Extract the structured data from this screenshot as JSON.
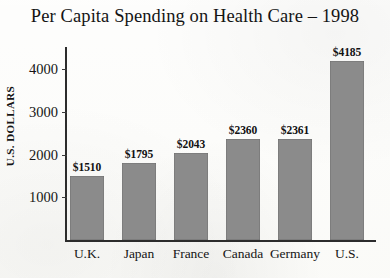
{
  "chart_data": {
    "type": "bar",
    "title": "Per Capita Spending on Health Care – 1998",
    "xlabel": "",
    "ylabel": "U.S. DOLLARS",
    "categories": [
      "U.K.",
      "Japan",
      "France",
      "Canada",
      "Germany",
      "U.S."
    ],
    "values": [
      1510,
      1795,
      2043,
      2360,
      2361,
      4185
    ],
    "value_labels": [
      "$1510",
      "$1795",
      "$2043",
      "$2360",
      "$2361",
      "$4185"
    ],
    "ylim": [
      0,
      4500
    ],
    "yticks": [
      1000,
      2000,
      3000,
      4000
    ],
    "ytick_labels": [
      "1000",
      "2000",
      "3000",
      "4000"
    ],
    "grid": false,
    "legend": null,
    "bar_color": "#8b8b8b",
    "axis_color": "#2c2c2c",
    "background_color": "#fcfcfa"
  }
}
